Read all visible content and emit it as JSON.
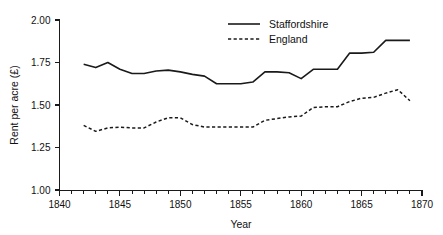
{
  "chart_data": {
    "type": "line",
    "title": "",
    "xlabel": "Year",
    "ylabel": "Rent per acre (£)",
    "xlim": [
      1840,
      1870
    ],
    "ylim": [
      1.0,
      2.0
    ],
    "grid": false,
    "legend_position": "top-center",
    "x_ticks_major": [
      1840,
      1845,
      1850,
      1855,
      1860,
      1865,
      1870
    ],
    "x_tick_labels": [
      "1840",
      "1845",
      "1850",
      "1855",
      "1860",
      "1865",
      "1870"
    ],
    "x_tick_minor_step": 1,
    "y_ticks": [
      1.0,
      1.25,
      1.5,
      1.75,
      2.0
    ],
    "y_tick_labels": [
      "1.00",
      "1.25",
      "1.50",
      "1.75",
      "2.00"
    ],
    "x": [
      1842,
      1843,
      1844,
      1845,
      1846,
      1847,
      1848,
      1849,
      1850,
      1851,
      1852,
      1853,
      1854,
      1855,
      1856,
      1857,
      1858,
      1859,
      1860,
      1861,
      1862,
      1863,
      1864,
      1865,
      1866,
      1867,
      1868,
      1869
    ],
    "series": [
      {
        "name": "Staffordshire",
        "style": "solid",
        "color": "#1a1a1a",
        "values": [
          1.74,
          1.72,
          1.75,
          1.71,
          1.685,
          1.685,
          1.7,
          1.705,
          1.695,
          1.68,
          1.67,
          1.625,
          1.625,
          1.625,
          1.635,
          1.695,
          1.695,
          1.69,
          1.655,
          1.71,
          1.71,
          1.71,
          1.805,
          1.805,
          1.81,
          1.88,
          1.88,
          1.88
        ]
      },
      {
        "name": "England",
        "style": "dashed",
        "color": "#1a1a1a",
        "values": [
          1.38,
          1.345,
          1.365,
          1.37,
          1.365,
          1.365,
          1.4,
          1.425,
          1.425,
          1.385,
          1.37,
          1.37,
          1.37,
          1.37,
          1.37,
          1.41,
          1.42,
          1.43,
          1.435,
          1.485,
          1.49,
          1.49,
          1.52,
          1.54,
          1.545,
          1.57,
          1.59,
          1.525
        ]
      }
    ]
  },
  "legend": {
    "entries": [
      {
        "label": "Staffordshire",
        "style": "solid"
      },
      {
        "label": "England",
        "style": "dashed"
      }
    ]
  },
  "axes": {
    "x_title": "Year",
    "y_title": "Rent per acre (£)"
  }
}
